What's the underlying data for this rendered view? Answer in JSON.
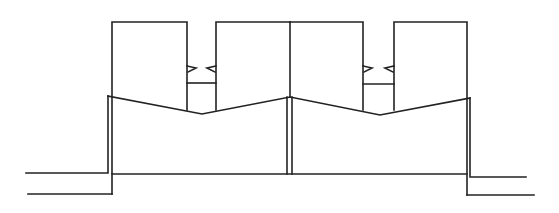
{
  "diagram": {
    "title": "",
    "stroke_color": "#222222",
    "background": "#ffffff",
    "stroke_width": 1.6,
    "blocks": [
      {
        "id": "block-1",
        "x": 112,
        "y": 22,
        "w": 75,
        "h": 88
      },
      {
        "id": "block-2",
        "x": 216,
        "y": 22,
        "w": 74,
        "h": 88
      },
      {
        "id": "block-3",
        "x": 290,
        "y": 22,
        "w": 73,
        "h": 88
      },
      {
        "id": "block-4",
        "x": 394,
        "y": 22,
        "w": 73,
        "h": 88
      }
    ],
    "notches": [
      {
        "id": "notch-left",
        "x1": 187,
        "x2": 216,
        "crossbar_y": 83,
        "wedge_y": 68
      },
      {
        "id": "notch-right",
        "x1": 363,
        "x2": 394,
        "crossbar_y": 84,
        "wedge_y": 68
      }
    ],
    "zigzag": [
      [
        108,
        96
      ],
      [
        202,
        114
      ],
      [
        290,
        97
      ],
      [
        380,
        115
      ],
      [
        470,
        98
      ]
    ],
    "labels": []
  }
}
